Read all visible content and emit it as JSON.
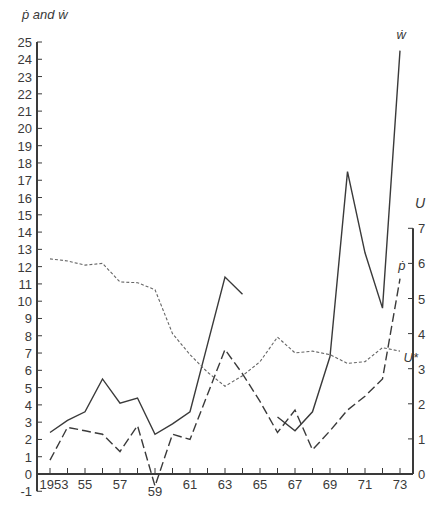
{
  "chart_data": {
    "type": "line",
    "title": "",
    "left_axis_label": "ṗ and ẇ",
    "right_axis_label": "U",
    "xlabel": "",
    "x": [
      1953,
      1954,
      1955,
      1956,
      1957,
      1958,
      1959,
      1960,
      1961,
      1962,
      1963,
      1964,
      1965,
      1966,
      1967,
      1968,
      1969,
      1970,
      1971,
      1972,
      1973
    ],
    "x_tick_labels": [
      "1953",
      "55",
      "57",
      "59",
      "61",
      "63",
      "65",
      "67",
      "69",
      "71",
      "73"
    ],
    "x_tick_label_years": [
      1953,
      1955,
      1957,
      1959,
      1961,
      1963,
      1965,
      1967,
      1969,
      1971,
      1973
    ],
    "left_ylim": [
      -1,
      25
    ],
    "left_ticks": [
      -1,
      0,
      1,
      2,
      3,
      4,
      5,
      6,
      7,
      8,
      9,
      10,
      11,
      12,
      13,
      14,
      15,
      16,
      17,
      18,
      19,
      20,
      21,
      22,
      23,
      24,
      25
    ],
    "right_ylim": [
      0,
      7
    ],
    "right_ticks": [
      0,
      1,
      2,
      3,
      4,
      5,
      6,
      7
    ],
    "grid": false,
    "series": [
      {
        "name": "ẇ",
        "axis": "left",
        "style": "solid",
        "values": [
          2.4,
          3.1,
          3.6,
          5.5,
          4.1,
          4.4,
          2.3,
          2.9,
          3.6,
          7.5,
          11.4,
          10.4,
          null,
          3.3,
          2.5,
          3.6,
          6.8,
          17.5,
          12.8,
          9.6,
          24.5
        ],
        "break_after": 1964,
        "label_pos": {
          "year": 1972.8,
          "value": 25.2
        }
      },
      {
        "name": "ṗ",
        "axis": "left",
        "style": "dashed",
        "values": [
          0.8,
          2.7,
          2.5,
          2.3,
          1.3,
          2.8,
          -0.7,
          2.3,
          2.0,
          4.6,
          7.2,
          5.8,
          4.2,
          2.4,
          3.7,
          1.4,
          2.5,
          3.7,
          4.5,
          5.5,
          11.3
        ],
        "label_pos": {
          "year": 1972.9,
          "value": 11.8
        }
      },
      {
        "name": "U*",
        "axis": "right",
        "style": "dotted",
        "values": [
          6.13,
          6.07,
          5.95,
          6.0,
          5.47,
          5.45,
          5.25,
          4.0,
          3.4,
          2.9,
          2.5,
          2.8,
          3.2,
          3.9,
          3.45,
          3.5,
          3.4,
          3.15,
          3.2,
          3.6,
          3.5
        ],
        "label_pos": {
          "year": 1973.2,
          "value": 3.2
        }
      }
    ]
  }
}
